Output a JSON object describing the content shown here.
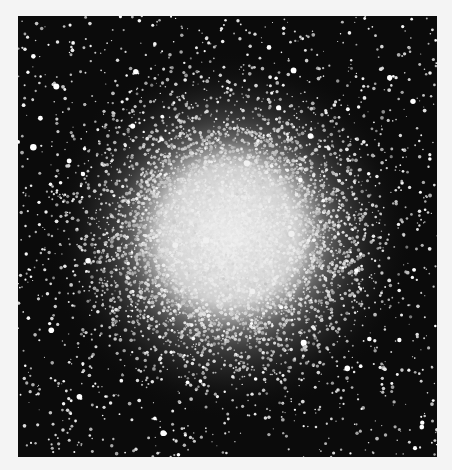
{
  "image": {
    "subject": "globular star cluster",
    "description": "Black-and-white astronomical photograph of a dense globular star cluster with a bright, saturated core fading into scattered stars on a black background",
    "background_color": "#0b0b0b",
    "page_color": "#f4f4f4",
    "star_color": "#ffffff",
    "frame": {
      "x": 18,
      "y": 16,
      "width": 419,
      "height": 441
    },
    "core_center": {
      "x": 212,
      "y": 219
    },
    "core_radius": 95
  }
}
